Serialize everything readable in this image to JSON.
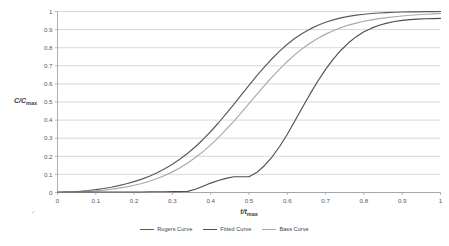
{
  "chart_data": {
    "type": "line",
    "title": "",
    "subtitle": "",
    "xlabel": "t/t_max",
    "ylabel": "C/C_max",
    "xlim": [
      0,
      1
    ],
    "ylim": [
      0,
      1
    ],
    "grid": "horizontal",
    "legend_position": "bottom",
    "xticks": [
      "0",
      "0.1",
      "0.2",
      "0.3",
      "0.4",
      "0.5",
      "0.6",
      "0.7",
      "0.8",
      "0.9",
      "1"
    ],
    "yticks": [
      "0",
      "0.1",
      "0.2",
      "0.3",
      "0.4",
      "0.5",
      "0.6",
      "0.7",
      "0.8",
      "0.9",
      "1"
    ],
    "x": [
      0,
      0.02,
      0.04,
      0.06,
      0.08,
      0.1,
      0.12,
      0.14,
      0.16,
      0.18,
      0.2,
      0.22,
      0.24,
      0.26,
      0.28,
      0.3,
      0.32,
      0.34,
      0.36,
      0.38,
      0.4,
      0.42,
      0.44,
      0.46,
      0.48,
      0.5,
      0.52,
      0.54,
      0.56,
      0.58,
      0.6,
      0.62,
      0.64,
      0.66,
      0.68,
      0.7,
      0.72,
      0.74,
      0.76,
      0.78,
      0.8,
      0.82,
      0.84,
      0.86,
      0.88,
      0.9,
      0.92,
      0.94,
      0.96,
      0.98,
      1.0
    ],
    "series": [
      {
        "name": "Rogers Curve",
        "color": "#5a5a5a",
        "values": [
          0.0,
          0.002,
          0.004,
          0.007,
          0.011,
          0.016,
          0.022,
          0.029,
          0.038,
          0.048,
          0.06,
          0.074,
          0.09,
          0.109,
          0.131,
          0.156,
          0.185,
          0.217,
          0.253,
          0.293,
          0.337,
          0.384,
          0.434,
          0.486,
          0.539,
          0.592,
          0.644,
          0.693,
          0.739,
          0.781,
          0.819,
          0.852,
          0.88,
          0.904,
          0.924,
          0.941,
          0.954,
          0.965,
          0.973,
          0.98,
          0.985,
          0.989,
          0.992,
          0.994,
          0.996,
          0.997,
          0.998,
          0.998,
          0.999,
          0.999,
          1.0
        ]
      },
      {
        "name": "Fitted Curve",
        "color": "#a8a8a8",
        "values": [
          0.0,
          0.001,
          0.002,
          0.004,
          0.006,
          0.009,
          0.013,
          0.018,
          0.024,
          0.031,
          0.04,
          0.05,
          0.062,
          0.077,
          0.094,
          0.114,
          0.137,
          0.163,
          0.193,
          0.226,
          0.263,
          0.303,
          0.347,
          0.393,
          0.441,
          0.491,
          0.541,
          0.59,
          0.637,
          0.682,
          0.724,
          0.762,
          0.796,
          0.826,
          0.852,
          0.875,
          0.894,
          0.911,
          0.925,
          0.936,
          0.946,
          0.954,
          0.961,
          0.966,
          0.971,
          0.975,
          0.979,
          0.982,
          0.985,
          0.987,
          0.99
        ]
      },
      {
        "name": "Bass Curve",
        "color": "#4f4f4f",
        "values": [
          0.003,
          0.003,
          0.003,
          0.003,
          0.003,
          0.003,
          0.003,
          0.003,
          0.003,
          0.003,
          0.003,
          0.003,
          0.004,
          0.004,
          0.004,
          0.005,
          0.005,
          0.006,
          0.018,
          0.035,
          0.052,
          0.066,
          0.078,
          0.087,
          0.087,
          0.087,
          0.11,
          0.148,
          0.196,
          0.254,
          0.322,
          0.396,
          0.472,
          0.546,
          0.616,
          0.68,
          0.737,
          0.786,
          0.827,
          0.861,
          0.888,
          0.908,
          0.924,
          0.936,
          0.945,
          0.951,
          0.955,
          0.958,
          0.96,
          0.961,
          0.962
        ]
      }
    ]
  },
  "legend": {
    "items": [
      {
        "label": "Rogers Curve",
        "color": "#5a5a5a"
      },
      {
        "label": "Fitted Curve",
        "color": "#4f4f4f"
      },
      {
        "label": "Bass Curve",
        "color": "#a8a8a8"
      }
    ]
  },
  "axes": {
    "y_title_main": "C/C",
    "y_title_sub": "max",
    "x_title_main": "t/t",
    "x_title_sub": "max"
  },
  "artifacts": {
    "stray_mark": "✓"
  },
  "colors": {
    "grid": "#c8c8c8",
    "axis": "#9a9a9a",
    "tick_text": "#595959"
  }
}
